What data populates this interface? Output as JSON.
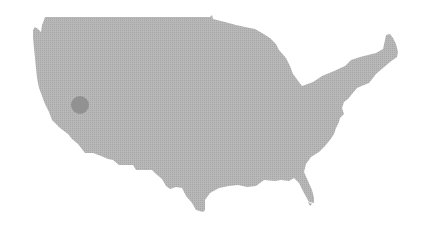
{
  "map": {
    "region": "United States (contiguous)",
    "fill_color": "#b4b4b4",
    "dot_color": "#a2a2a2",
    "background": "#ffffff",
    "markers": [
      {
        "name": "california-marker",
        "cx": 80,
        "cy": 105,
        "r": 9,
        "color": "#8e8e8e"
      }
    ]
  }
}
